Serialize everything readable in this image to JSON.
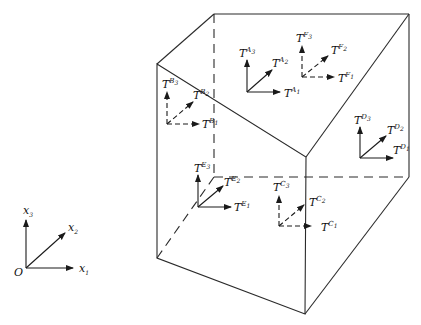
{
  "figure": {
    "type": "cube-with-local-triads",
    "colors": {
      "stroke": "#2a2a2a",
      "background": "#ffffff"
    }
  },
  "global_axes": {
    "origin_label": "O",
    "axes": [
      {
        "name": "x1",
        "label": "x",
        "sub": "1"
      },
      {
        "name": "x2",
        "label": "x",
        "sub": "2"
      },
      {
        "name": "x3",
        "label": "x",
        "sub": "3"
      }
    ]
  },
  "triads": [
    {
      "id": "A",
      "style": "solid",
      "labels": [
        {
          "base": "T",
          "sup": "A",
          "sub": "1"
        },
        {
          "base": "T",
          "sup": "A",
          "sub": "2"
        },
        {
          "base": "T",
          "sup": "A",
          "sub": "3"
        }
      ]
    },
    {
      "id": "F",
      "style": "dashed",
      "labels": [
        {
          "base": "T",
          "sup": "F",
          "sub": "1"
        },
        {
          "base": "T",
          "sup": "F",
          "sub": "2"
        },
        {
          "base": "T",
          "sup": "F",
          "sub": "3"
        }
      ]
    },
    {
      "id": "B",
      "style": "dashed",
      "labels": [
        {
          "base": "T",
          "sup": "B",
          "sub": "1"
        },
        {
          "base": "T",
          "sup": "B",
          "sub": "2"
        },
        {
          "base": "T",
          "sup": "B",
          "sub": "3"
        }
      ]
    },
    {
      "id": "D",
      "style": "solid",
      "labels": [
        {
          "base": "T",
          "sup": "D",
          "sub": "1"
        },
        {
          "base": "T",
          "sup": "D",
          "sub": "2"
        },
        {
          "base": "T",
          "sup": "D",
          "sub": "3"
        }
      ]
    },
    {
      "id": "E",
      "style": "solid",
      "labels": [
        {
          "base": "T",
          "sup": "E",
          "sub": "1"
        },
        {
          "base": "T",
          "sup": "E",
          "sub": "2"
        },
        {
          "base": "T",
          "sup": "E",
          "sub": "3"
        }
      ]
    },
    {
      "id": "C",
      "style": "dashed",
      "labels": [
        {
          "base": "T",
          "sup": "C",
          "sub": "1"
        },
        {
          "base": "T",
          "sup": "C",
          "sub": "2"
        },
        {
          "base": "T",
          "sup": "C",
          "sub": "3"
        }
      ]
    }
  ]
}
